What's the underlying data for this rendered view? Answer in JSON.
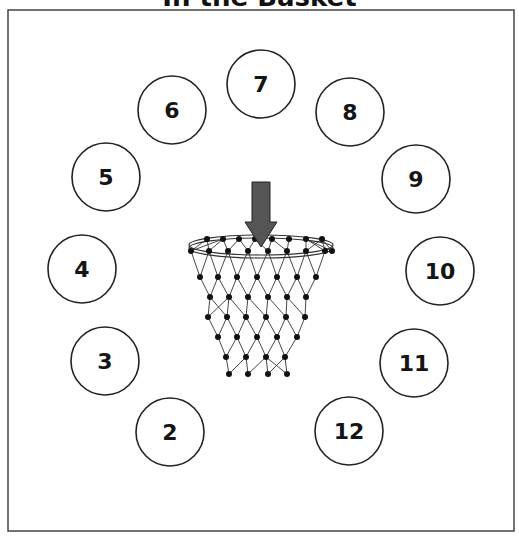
{
  "title": "In the Basket",
  "basket": {
    "arrow_color": "#555555",
    "line_color": "#333333",
    "dot_color": "#111111"
  },
  "circles": [
    {
      "label": "2"
    },
    {
      "label": "3"
    },
    {
      "label": "4"
    },
    {
      "label": "5"
    },
    {
      "label": "6"
    },
    {
      "label": "7"
    },
    {
      "label": "8"
    },
    {
      "label": "9"
    },
    {
      "label": "10"
    },
    {
      "label": "11"
    },
    {
      "label": "12"
    }
  ]
}
